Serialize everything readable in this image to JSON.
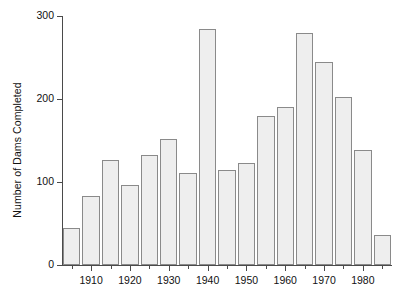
{
  "chart_data": {
    "type": "bar",
    "title": "",
    "subtitle": "",
    "xlabel": "",
    "ylabel": "Number of Dams Completed",
    "categories": [
      1905,
      1910,
      1915,
      1920,
      1925,
      1930,
      1935,
      1940,
      1945,
      1950,
      1955,
      1960,
      1965,
      1970,
      1975,
      1980,
      1985
    ],
    "values": [
      45,
      83,
      127,
      97,
      133,
      152,
      111,
      284,
      115,
      123,
      180,
      190,
      280,
      245,
      203,
      138,
      36
    ],
    "bar_width_years": 5,
    "xlim": [
      1902.5,
      1987.5
    ],
    "ylim": [
      0,
      300
    ],
    "y_ticks": [
      0,
      100,
      200,
      300
    ],
    "y_tick_labels": [
      "0",
      "100",
      "200",
      "300"
    ],
    "x_ticks": [
      1910,
      1920,
      1930,
      1940,
      1950,
      1960,
      1970,
      1980
    ],
    "x_tick_labels": [
      "1910",
      "1920",
      "1930",
      "1940",
      "1950",
      "1960",
      "1970",
      "1980"
    ],
    "x_minor_ticks": [
      1905,
      1915,
      1925,
      1935,
      1945,
      1955,
      1965,
      1975,
      1985
    ],
    "grid": false,
    "legend": false,
    "legend_position": "none",
    "bar_fill_color": "#eeeeee",
    "bar_edge_color": "#8a8a8a",
    "axis_color": "#4a4a4a",
    "background_color": "#ffffff",
    "text_color": "#111111"
  }
}
